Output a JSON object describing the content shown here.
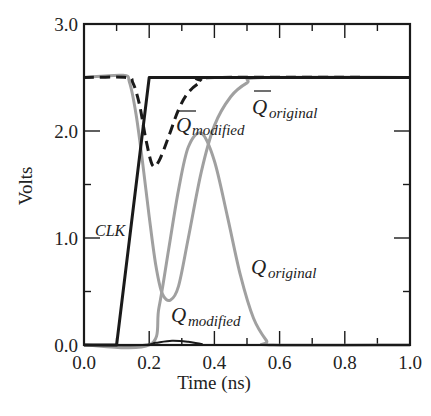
{
  "chart_data": {
    "type": "line",
    "title": "",
    "xlabel": "Time (ns)",
    "ylabel": "Volts",
    "xlim": [
      0.0,
      1.0
    ],
    "ylim": [
      0.0,
      3.0
    ],
    "x_ticks": [
      "0.0",
      "0.2",
      "0.4",
      "0.6",
      "0.8",
      "1.0"
    ],
    "y_ticks": [
      "0.0",
      "1.0",
      "2.0",
      "3.0"
    ],
    "grid": false,
    "legend": "inline labels",
    "series": [
      {
        "name": "CLK",
        "style": "solid",
        "color": "#1a1a1a",
        "x": [
          0.0,
          0.1,
          0.2,
          1.0
        ],
        "values": [
          0.0,
          0.0,
          2.5,
          2.5
        ]
      },
      {
        "name": "Q̄_modified",
        "style": "dashed",
        "color": "#1a1a1a",
        "x": [
          0.0,
          0.13,
          0.15,
          0.17,
          0.19,
          0.21,
          0.23,
          0.26,
          0.29,
          0.32,
          0.36,
          0.4,
          1.0
        ],
        "values": [
          2.5,
          2.5,
          2.45,
          2.25,
          1.92,
          1.68,
          1.72,
          1.95,
          2.2,
          2.36,
          2.46,
          2.5,
          2.5
        ]
      },
      {
        "name": "Q̄_original",
        "style": "solid",
        "color": "#a0a0a0",
        "x": [
          0.0,
          0.12,
          0.14,
          0.16,
          0.18,
          0.2,
          0.22,
          0.24,
          0.265,
          0.29,
          0.32,
          0.36,
          0.4,
          0.45,
          0.5,
          0.55,
          1.0
        ],
        "values": [
          2.5,
          2.52,
          2.45,
          2.15,
          1.7,
          1.2,
          0.75,
          0.48,
          0.42,
          0.55,
          1.0,
          1.62,
          2.05,
          2.32,
          2.45,
          2.5,
          2.5
        ]
      },
      {
        "name": "Q_original",
        "style": "solid",
        "color": "#a0a0a0",
        "x": [
          0.0,
          0.2,
          0.23,
          0.26,
          0.29,
          0.32,
          0.36,
          0.4,
          0.44,
          0.48,
          0.52,
          0.56,
          0.58,
          1.0
        ],
        "values": [
          0.0,
          0.0,
          0.35,
          0.9,
          1.45,
          1.85,
          1.98,
          1.72,
          1.2,
          0.65,
          0.25,
          0.04,
          0.0,
          0.0
        ]
      },
      {
        "name": "Q_modified",
        "style": "solid",
        "color": "#1a1a1a",
        "x": [
          0.0,
          0.18,
          0.22,
          0.27,
          0.32,
          0.36,
          0.4,
          1.0
        ],
        "values": [
          0.0,
          0.0,
          0.02,
          0.04,
          0.03,
          0.01,
          0.0,
          0.0
        ]
      }
    ],
    "annotations": [
      {
        "text": "CLK",
        "x": 0.06,
        "y": 1.55
      },
      {
        "text": "Q̄_modified",
        "x": 0.25,
        "y": 2.1
      },
      {
        "text": "Q̄_original",
        "x": 0.47,
        "y": 2.15
      },
      {
        "text": "Q_original",
        "x": 0.45,
        "y": 0.85
      },
      {
        "text": "Q_modified",
        "x": 0.27,
        "y": 0.15
      }
    ]
  },
  "labels": {
    "clk": "CLK",
    "qbar_modified_base": "Q",
    "qbar_modified_sub": "modified",
    "qbar_original_base": "Q",
    "qbar_original_sub": "original",
    "q_original_base": "Q",
    "q_original_sub": "original",
    "q_modified_base": "Q",
    "q_modified_sub": "modified"
  }
}
